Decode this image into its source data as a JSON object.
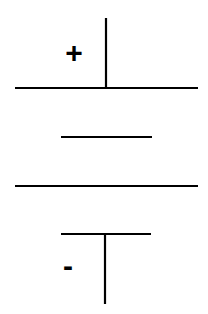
{
  "diagram": {
    "type": "battery-cell-symbol",
    "stroke_color": "#000000",
    "background_color": "#ffffff",
    "terminals": {
      "positive": {
        "label": "+"
      },
      "negative": {
        "label": "-"
      }
    },
    "elements": [
      {
        "id": "positive-lead",
        "kind": "line",
        "x1": 106,
        "y1": 18,
        "x2": 106,
        "y2": 88
      },
      {
        "id": "positive-plate-long",
        "kind": "line",
        "x1": 15,
        "y1": 88,
        "x2": 198,
        "y2": 88
      },
      {
        "id": "negative-plate-short-1",
        "kind": "line",
        "x1": 61,
        "y1": 137,
        "x2": 152,
        "y2": 137
      },
      {
        "id": "positive-plate-long-2",
        "kind": "line",
        "x1": 15,
        "y1": 186,
        "x2": 198,
        "y2": 186
      },
      {
        "id": "negative-plate-short-2",
        "kind": "line",
        "x1": 61,
        "y1": 234,
        "x2": 151,
        "y2": 234
      },
      {
        "id": "negative-lead",
        "kind": "line",
        "x1": 105,
        "y1": 234,
        "x2": 105,
        "y2": 304
      }
    ]
  }
}
